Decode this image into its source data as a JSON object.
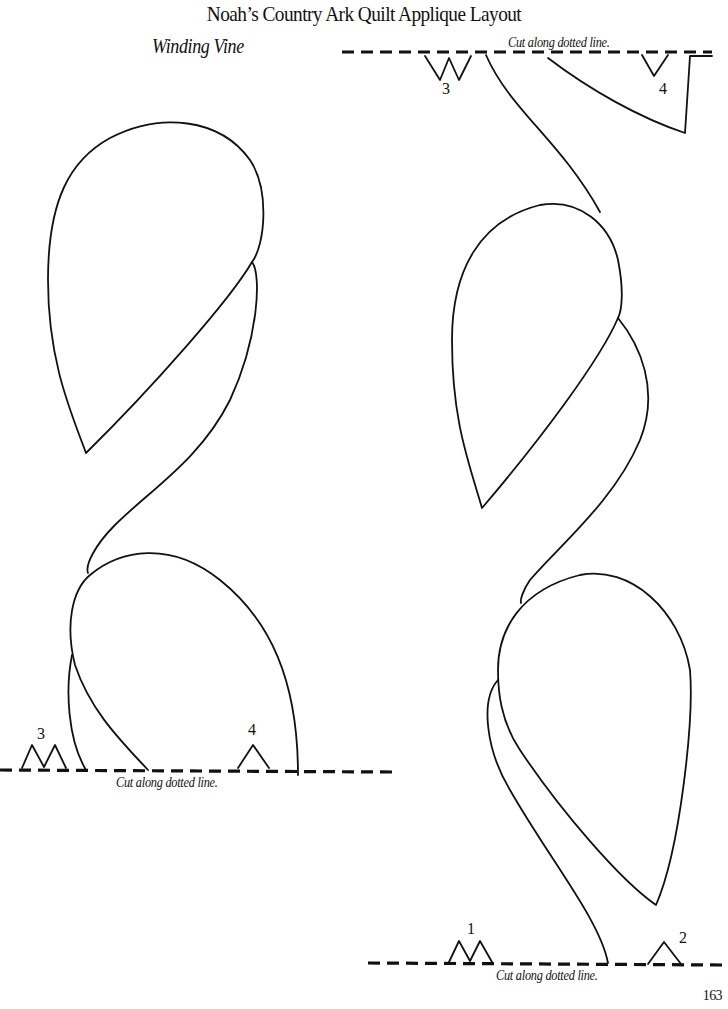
{
  "header": {
    "title": "Noah’s Country Ark Quilt Applique Layout",
    "subtitle": "Winding Vine"
  },
  "cut_lines": {
    "top_right": {
      "label": "Cut along dotted line."
    },
    "left_bottom": {
      "label": "Cut along dotted line."
    },
    "right_bottom": {
      "label": "Cut along dotted line."
    }
  },
  "notches": {
    "top_3": "3",
    "top_4": "4",
    "left_3": "3",
    "left_4": "4",
    "bottom_1": "1",
    "bottom_2": "2"
  },
  "footer": {
    "page_number": "163"
  },
  "colors": {
    "ink": "#111111",
    "paper": "#ffffff"
  }
}
